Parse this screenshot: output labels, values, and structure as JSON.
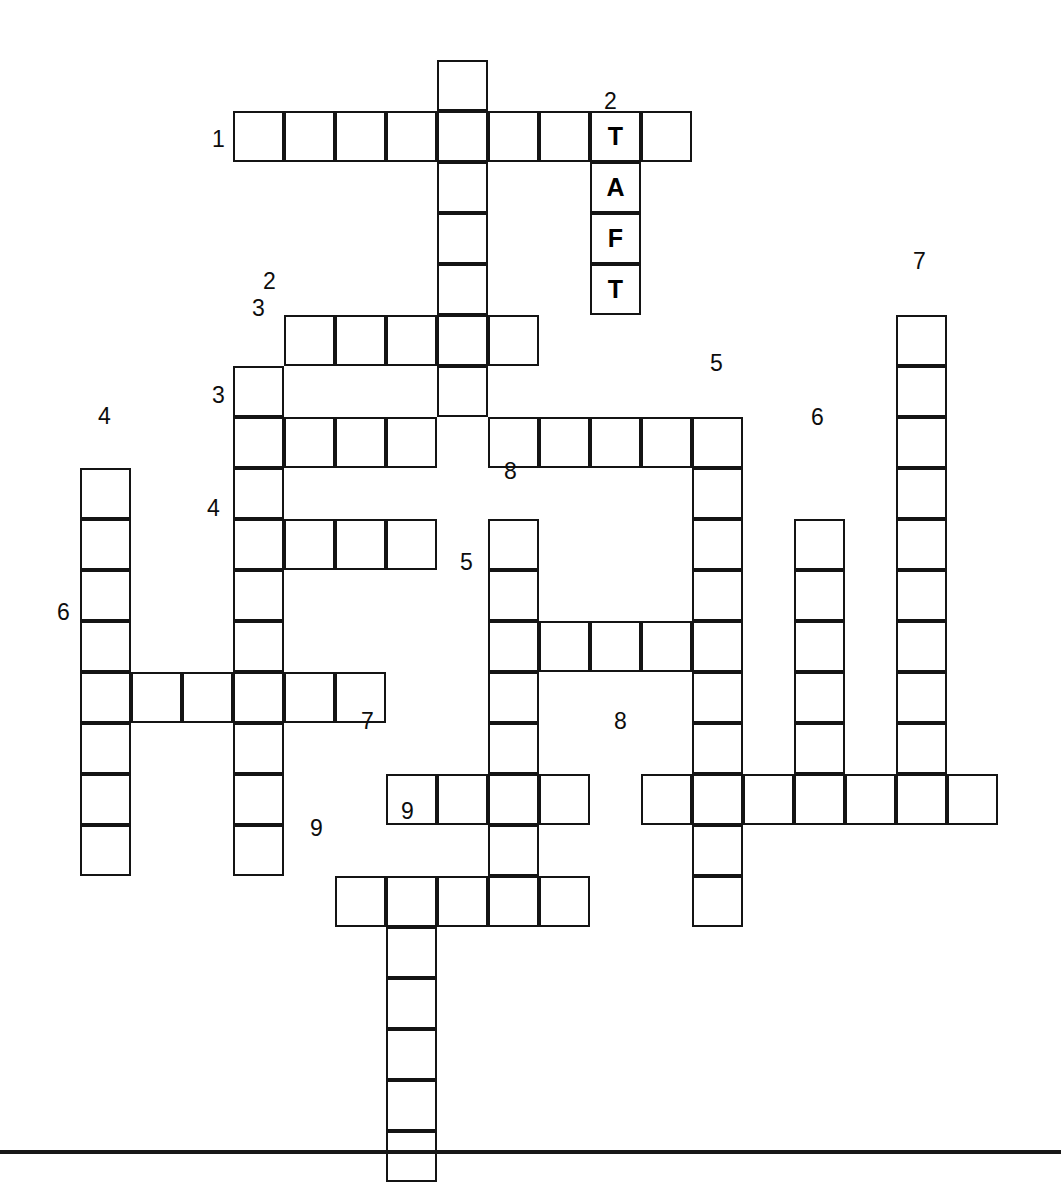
{
  "puzzle": {
    "title": "Crossword Puzzle Grid",
    "cell_size": 51,
    "origin_x": 80,
    "origin_y": 60,
    "border_color": "#141414",
    "cell_fill": "#ffffff",
    "letter_color": "#000000",
    "number_color": "#0d0d0d",
    "prefilled_word": "TAFT",
    "prefilled_letters": [
      "T",
      "A",
      "F",
      "T"
    ],
    "across_count": 9,
    "down_count": 9,
    "entries": [
      {
        "number": "1",
        "direction": "across",
        "col": 3,
        "row": 1,
        "length": 9,
        "label_side": "left"
      },
      {
        "number": "2",
        "direction": "across",
        "col": 4,
        "row": 5,
        "length": 5,
        "label_side": "left"
      },
      {
        "number": "3",
        "direction": "across",
        "col": 3,
        "row": 7,
        "length": 10,
        "label_side": "left"
      },
      {
        "number": "4",
        "direction": "across",
        "col": 3,
        "row": 9,
        "length": 4,
        "label_side": "left"
      },
      {
        "number": "5",
        "direction": "across",
        "col": 8,
        "row": 11,
        "length": 5,
        "label_side": "left"
      },
      {
        "number": "6",
        "direction": "across",
        "col": 0,
        "row": 12,
        "length": 6,
        "label_side": "left"
      },
      {
        "number": "7",
        "direction": "across",
        "col": 6,
        "row": 14,
        "length": 4,
        "label_side": "left"
      },
      {
        "number": "8",
        "direction": "across",
        "col": 11,
        "row": 14,
        "length": 7,
        "label_side": "left"
      },
      {
        "number": "9",
        "direction": "across",
        "col": 5,
        "row": 16,
        "length": 5,
        "label_side": "left"
      },
      {
        "number": "1",
        "direction": "down",
        "col": 7,
        "row": 0,
        "length": 7,
        "label_side": "none"
      },
      {
        "number": "2",
        "direction": "down",
        "col": 10,
        "row": 1,
        "length": 4,
        "label_side": "top"
      },
      {
        "number": "3",
        "direction": "down",
        "col": 3,
        "row": 6,
        "length": 9,
        "label_side": "top"
      },
      {
        "number": "4",
        "direction": "down",
        "col": 0,
        "row": 8,
        "length": 7,
        "label_side": "top"
      },
      {
        "number": "5",
        "direction": "down",
        "col": 12,
        "row": 7,
        "length": 9,
        "label_side": "top"
      },
      {
        "number": "6",
        "direction": "down",
        "col": 14,
        "row": 8,
        "length": 6,
        "label_side": "top"
      },
      {
        "number": "7",
        "direction": "down",
        "col": 16,
        "row": 5,
        "length": 10,
        "label_side": "top"
      },
      {
        "number": "8",
        "direction": "down",
        "col": 8,
        "row": 9,
        "length": 7,
        "label_side": "top"
      },
      {
        "number": "9",
        "direction": "down",
        "col": 6,
        "row": 16,
        "length": 6,
        "label_side": "top"
      }
    ],
    "cells": [
      {
        "col": 3,
        "row": 1,
        "letter": ""
      },
      {
        "col": 4,
        "row": 1,
        "letter": ""
      },
      {
        "col": 5,
        "row": 1,
        "letter": ""
      },
      {
        "col": 6,
        "row": 1,
        "letter": ""
      },
      {
        "col": 7,
        "row": 1,
        "letter": ""
      },
      {
        "col": 8,
        "row": 1,
        "letter": ""
      },
      {
        "col": 9,
        "row": 1,
        "letter": ""
      },
      {
        "col": 10,
        "row": 1,
        "letter": "T"
      },
      {
        "col": 11,
        "row": 1,
        "letter": ""
      },
      {
        "col": 7,
        "row": 0,
        "letter": ""
      },
      {
        "col": 7,
        "row": 2,
        "letter": ""
      },
      {
        "col": 7,
        "row": 3,
        "letter": ""
      },
      {
        "col": 7,
        "row": 4,
        "letter": ""
      },
      {
        "col": 7,
        "row": 5,
        "letter": ""
      },
      {
        "col": 7,
        "row": 6,
        "letter": ""
      },
      {
        "col": 10,
        "row": 2,
        "letter": "A"
      },
      {
        "col": 10,
        "row": 3,
        "letter": "F"
      },
      {
        "col": 10,
        "row": 4,
        "letter": "T"
      },
      {
        "col": 4,
        "row": 5,
        "letter": ""
      },
      {
        "col": 5,
        "row": 5,
        "letter": ""
      },
      {
        "col": 6,
        "row": 5,
        "letter": ""
      },
      {
        "col": 8,
        "row": 5,
        "letter": ""
      },
      {
        "col": 3,
        "row": 6,
        "letter": ""
      },
      {
        "col": 3,
        "row": 7,
        "letter": ""
      },
      {
        "col": 4,
        "row": 7,
        "letter": ""
      },
      {
        "col": 5,
        "row": 7,
        "letter": ""
      },
      {
        "col": 6,
        "row": 7,
        "letter": ""
      },
      {
        "col": 8,
        "row": 7,
        "letter": ""
      },
      {
        "col": 9,
        "row": 7,
        "letter": ""
      },
      {
        "col": 10,
        "row": 7,
        "letter": ""
      },
      {
        "col": 11,
        "row": 7,
        "letter": ""
      },
      {
        "col": 12,
        "row": 7,
        "letter": ""
      },
      {
        "col": 3,
        "row": 8,
        "letter": ""
      },
      {
        "col": 12,
        "row": 8,
        "letter": ""
      },
      {
        "col": 0,
        "row": 8,
        "letter": ""
      },
      {
        "col": 3,
        "row": 9,
        "letter": ""
      },
      {
        "col": 4,
        "row": 9,
        "letter": ""
      },
      {
        "col": 5,
        "row": 9,
        "letter": ""
      },
      {
        "col": 6,
        "row": 9,
        "letter": ""
      },
      {
        "col": 0,
        "row": 9,
        "letter": ""
      },
      {
        "col": 8,
        "row": 9,
        "letter": ""
      },
      {
        "col": 12,
        "row": 9,
        "letter": ""
      },
      {
        "col": 14,
        "row": 9,
        "letter": ""
      },
      {
        "col": 16,
        "row": 5,
        "letter": ""
      },
      {
        "col": 16,
        "row": 6,
        "letter": ""
      },
      {
        "col": 16,
        "row": 7,
        "letter": ""
      },
      {
        "col": 16,
        "row": 8,
        "letter": ""
      },
      {
        "col": 16,
        "row": 9,
        "letter": ""
      },
      {
        "col": 16,
        "row": 10,
        "letter": ""
      },
      {
        "col": 16,
        "row": 11,
        "letter": ""
      },
      {
        "col": 16,
        "row": 12,
        "letter": ""
      },
      {
        "col": 16,
        "row": 13,
        "letter": ""
      },
      {
        "col": 16,
        "row": 14,
        "letter": ""
      },
      {
        "col": 3,
        "row": 10,
        "letter": ""
      },
      {
        "col": 0,
        "row": 10,
        "letter": ""
      },
      {
        "col": 8,
        "row": 10,
        "letter": ""
      },
      {
        "col": 12,
        "row": 10,
        "letter": ""
      },
      {
        "col": 14,
        "row": 10,
        "letter": ""
      },
      {
        "col": 8,
        "row": 11,
        "letter": ""
      },
      {
        "col": 9,
        "row": 11,
        "letter": ""
      },
      {
        "col": 10,
        "row": 11,
        "letter": ""
      },
      {
        "col": 11,
        "row": 11,
        "letter": ""
      },
      {
        "col": 12,
        "row": 11,
        "letter": ""
      },
      {
        "col": 3,
        "row": 11,
        "letter": ""
      },
      {
        "col": 0,
        "row": 11,
        "letter": ""
      },
      {
        "col": 14,
        "row": 11,
        "letter": ""
      },
      {
        "col": 0,
        "row": 12,
        "letter": ""
      },
      {
        "col": 1,
        "row": 12,
        "letter": ""
      },
      {
        "col": 2,
        "row": 12,
        "letter": ""
      },
      {
        "col": 3,
        "row": 12,
        "letter": ""
      },
      {
        "col": 4,
        "row": 12,
        "letter": ""
      },
      {
        "col": 5,
        "row": 12,
        "letter": ""
      },
      {
        "col": 8,
        "row": 12,
        "letter": ""
      },
      {
        "col": 12,
        "row": 12,
        "letter": ""
      },
      {
        "col": 14,
        "row": 12,
        "letter": ""
      },
      {
        "col": 0,
        "row": 13,
        "letter": ""
      },
      {
        "col": 3,
        "row": 13,
        "letter": ""
      },
      {
        "col": 8,
        "row": 13,
        "letter": ""
      },
      {
        "col": 12,
        "row": 13,
        "letter": ""
      },
      {
        "col": 14,
        "row": 13,
        "letter": ""
      },
      {
        "col": 6,
        "row": 14,
        "letter": ""
      },
      {
        "col": 7,
        "row": 14,
        "letter": ""
      },
      {
        "col": 8,
        "row": 14,
        "letter": ""
      },
      {
        "col": 9,
        "row": 14,
        "letter": ""
      },
      {
        "col": 11,
        "row": 14,
        "letter": ""
      },
      {
        "col": 12,
        "row": 14,
        "letter": ""
      },
      {
        "col": 13,
        "row": 14,
        "letter": ""
      },
      {
        "col": 14,
        "row": 14,
        "letter": ""
      },
      {
        "col": 15,
        "row": 14,
        "letter": ""
      },
      {
        "col": 17,
        "row": 14,
        "letter": ""
      },
      {
        "col": 0,
        "row": 14,
        "letter": ""
      },
      {
        "col": 3,
        "row": 14,
        "letter": ""
      },
      {
        "col": 0,
        "row": 15,
        "letter": ""
      },
      {
        "col": 3,
        "row": 15,
        "letter": ""
      },
      {
        "col": 8,
        "row": 15,
        "letter": ""
      },
      {
        "col": 12,
        "row": 15,
        "letter": ""
      },
      {
        "col": 5,
        "row": 16,
        "letter": ""
      },
      {
        "col": 6,
        "row": 16,
        "letter": ""
      },
      {
        "col": 7,
        "row": 16,
        "letter": ""
      },
      {
        "col": 8,
        "row": 16,
        "letter": ""
      },
      {
        "col": 9,
        "row": 16,
        "letter": ""
      },
      {
        "col": 12,
        "row": 16,
        "letter": ""
      },
      {
        "col": 6,
        "row": 17,
        "letter": ""
      },
      {
        "col": 6,
        "row": 18,
        "letter": ""
      },
      {
        "col": 6,
        "row": 19,
        "letter": ""
      },
      {
        "col": 6,
        "row": 20,
        "letter": ""
      },
      {
        "col": 6,
        "row": 21,
        "letter": ""
      }
    ],
    "numbers": [
      {
        "text": "1",
        "x": 212,
        "y": 128,
        "name": "clue-number-1-across"
      },
      {
        "text": "2",
        "x": 604,
        "y": 90,
        "name": "clue-number-2-down"
      },
      {
        "text": "2",
        "x": 263,
        "y": 270,
        "name": "clue-number-2-across"
      },
      {
        "text": "3",
        "x": 252,
        "y": 297,
        "name": "clue-number-3-down"
      },
      {
        "text": "3",
        "x": 212,
        "y": 384,
        "name": "clue-number-3-across"
      },
      {
        "text": "5",
        "x": 710,
        "y": 352,
        "name": "clue-number-5-down"
      },
      {
        "text": "7",
        "x": 913,
        "y": 250,
        "name": "clue-number-7-down"
      },
      {
        "text": "4",
        "x": 98,
        "y": 405,
        "name": "clue-number-4-down"
      },
      {
        "text": "6",
        "x": 811,
        "y": 406,
        "name": "clue-number-6-down"
      },
      {
        "text": "4",
        "x": 207,
        "y": 497,
        "name": "clue-number-4-across"
      },
      {
        "text": "8",
        "x": 504,
        "y": 460,
        "name": "clue-number-8-down"
      },
      {
        "text": "5",
        "x": 460,
        "y": 551,
        "name": "clue-number-5-across"
      },
      {
        "text": "6",
        "x": 57,
        "y": 601,
        "name": "clue-number-6-across"
      },
      {
        "text": "7",
        "x": 361,
        "y": 710,
        "name": "clue-number-7-across"
      },
      {
        "text": "8",
        "x": 614,
        "y": 710,
        "name": "clue-number-8-across"
      },
      {
        "text": "9",
        "x": 401,
        "y": 800,
        "name": "clue-number-9-down"
      },
      {
        "text": "9",
        "x": 310,
        "y": 817,
        "name": "clue-number-9-across"
      }
    ]
  }
}
